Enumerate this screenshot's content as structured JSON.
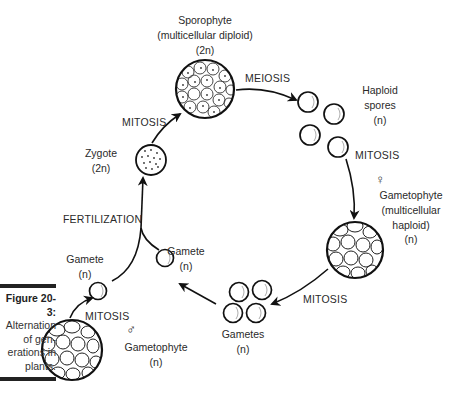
{
  "caption": {
    "title": "Figure 20-3:",
    "lines": [
      "Alternation",
      "of gen-",
      "erations in",
      "plants."
    ]
  },
  "nodes": {
    "sporophyte": {
      "name": "Sporophyte",
      "desc": "(multicellular diploid)",
      "ploidy": "(2n)"
    },
    "haploid_spores": {
      "name1": "Haploid",
      "name2": "spores",
      "ploidy": "(n)"
    },
    "female_gametophyte": {
      "symbol": "♀",
      "name": "Gametophyte",
      "desc1": "(multicellular",
      "desc2": "haploid)",
      "ploidy": "(n)"
    },
    "gametes": {
      "name": "Gametes",
      "ploidy": "(n)"
    },
    "gamete_right": {
      "name": "Gamete",
      "ploidy": "(n)"
    },
    "gamete_left": {
      "name": "Gamete",
      "ploidy": "(n)"
    },
    "zygote": {
      "name": "Zygote",
      "ploidy": "(2n)"
    },
    "male_gametophyte": {
      "symbol": "♂",
      "name": "Gametophyte",
      "ploidy": "(n)"
    }
  },
  "processes": {
    "meiosis": "MEIOSIS",
    "mitosis_spores": "MITOSIS",
    "mitosis_gametes": "MITOSIS",
    "fertilization": "FERTILIZATION",
    "mitosis_zygote": "MITOSIS",
    "mitosis_male": "MITOSIS"
  }
}
